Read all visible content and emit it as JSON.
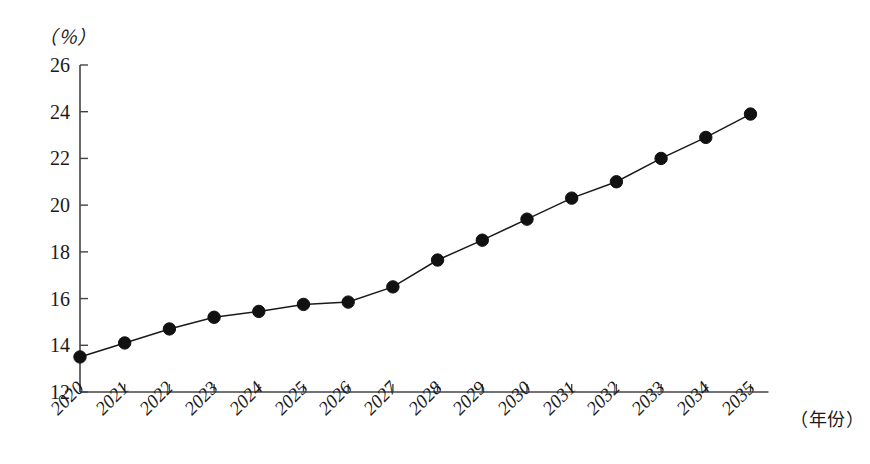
{
  "chart_data": {
    "type": "line",
    "title": "",
    "xlabel": "（年份）",
    "ylabel": "（％）",
    "categories": [
      "2020",
      "2021",
      "2022",
      "2023",
      "2024",
      "2025",
      "2026",
      "2027",
      "2028",
      "2029",
      "2030",
      "2031",
      "2032",
      "2033",
      "2034",
      "2035"
    ],
    "values": [
      13.5,
      14.1,
      14.7,
      15.2,
      15.45,
      15.75,
      15.85,
      16.5,
      17.65,
      18.5,
      19.4,
      20.3,
      21.0,
      22.0,
      22.9,
      23.9
    ],
    "series": [
      {
        "name": "比重",
        "values": [
          13.5,
          14.1,
          14.7,
          15.2,
          15.45,
          15.75,
          15.85,
          16.5,
          17.65,
          18.5,
          19.4,
          20.3,
          21.0,
          22.0,
          22.9,
          23.9
        ]
      }
    ],
    "ylim": [
      12,
      26
    ],
    "yticks": [
      12,
      14,
      16,
      18,
      20,
      22,
      24,
      26
    ],
    "ytick_labels": [
      "12",
      "14",
      "16",
      "18",
      "20",
      "22",
      "24",
      "26"
    ],
    "xtick_labels": [
      "2020",
      "2021",
      "2022",
      "2023",
      "2024",
      "2025",
      "2026",
      "2027",
      "2028",
      "2029",
      "2030",
      "2031",
      "2032",
      "2033",
      "2034",
      "2035"
    ],
    "grid": false,
    "legend": null,
    "marker": "filled-circle",
    "line_color": "#1a1a1a",
    "marker_color": "#111111",
    "axis_color": "#444444",
    "background": "#ffffff"
  },
  "labels": {
    "y_unit": "（％）",
    "x_unit": "（年份）"
  }
}
